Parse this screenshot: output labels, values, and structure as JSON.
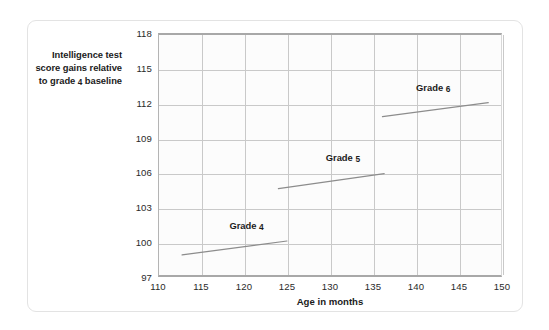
{
  "figure": {
    "y_axis_caption_lines": [
      "Intelligence test",
      "score gains relative",
      "to grade 4 baseline"
    ],
    "x_axis_title": "Age in months"
  },
  "chart_data": {
    "type": "line",
    "title": "",
    "subtitle": "",
    "xlabel": "Age in months",
    "ylabel": "Intelligence test score gains relative to grade 4 baseline",
    "xlim": [
      110,
      150
    ],
    "ylim": [
      97,
      118
    ],
    "xticks": [
      110,
      115,
      120,
      125,
      130,
      135,
      140,
      145,
      150
    ],
    "yticks": [
      97,
      100,
      103,
      106,
      109,
      112,
      115,
      118
    ],
    "grid": true,
    "legend_position": "inline-annotations",
    "series": [
      {
        "name": "Grade 4",
        "label": "Grade 4",
        "color": "#8c8c8c",
        "x": [
          112.8,
          125.0
        ],
        "y": [
          98.9,
          100.1
        ],
        "label_x": 120.3,
        "label_y": 101.4
      },
      {
        "name": "Grade 5",
        "label": "Grade 5",
        "color": "#8c8c8c",
        "x": [
          124.0,
          136.3
        ],
        "y": [
          104.6,
          105.9
        ],
        "label_x": 131.5,
        "label_y": 107.2
      },
      {
        "name": "Grade 6",
        "label": "Grade 6",
        "color": "#8c8c8c",
        "x": [
          136.1,
          148.4
        ],
        "y": [
          110.8,
          112.0
        ],
        "label_x": 142.0,
        "label_y": 113.3
      }
    ]
  },
  "style": {
    "card_border": "#e3e3e3",
    "gridline": "#c9c9c9",
    "axis_line": "#a8a8a8",
    "plot_background": "#fcfcfc",
    "series_color": "#8c8c8c",
    "text_color": "#1b1b1b"
  }
}
